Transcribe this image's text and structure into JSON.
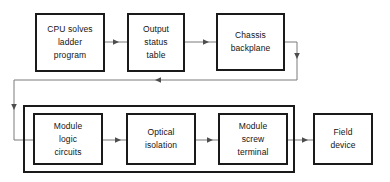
{
  "diagram": {
    "stroke_color": "#1a1a1a",
    "connector_color": "#7a7a7a",
    "background_color": "#ffffff",
    "nodes": [
      {
        "id": "cpu-solves-ladder-program",
        "lines": [
          "CPU solves",
          "ladder",
          "program"
        ],
        "x": 35,
        "y": 13,
        "w": 70,
        "h": 59
      },
      {
        "id": "output-status-table",
        "lines": [
          "Output",
          "status",
          "table"
        ],
        "x": 127,
        "y": 13,
        "w": 58,
        "h": 59
      },
      {
        "id": "chassis-backplane",
        "lines": [
          "Chassis",
          "backplane"
        ],
        "x": 216,
        "y": 13,
        "w": 69,
        "h": 58
      },
      {
        "id": "module-logic-circuits",
        "lines": [
          "Module",
          "logic",
          "circuits"
        ],
        "x": 33,
        "y": 113,
        "w": 70,
        "h": 52
      },
      {
        "id": "optical-isolation",
        "lines": [
          "Optical",
          "isolation"
        ],
        "x": 126,
        "y": 113,
        "w": 70,
        "h": 52
      },
      {
        "id": "module-screw-terminal",
        "lines": [
          "Module",
          "screw",
          "terminal"
        ],
        "x": 218,
        "y": 113,
        "w": 70,
        "h": 52
      },
      {
        "id": "field-device",
        "lines": [
          "Field",
          "device"
        ],
        "x": 313,
        "y": 113,
        "w": 60,
        "h": 52
      }
    ],
    "groups": [
      {
        "id": "io-module-group",
        "label": "",
        "x": 23,
        "y": 105,
        "w": 272,
        "h": 68
      }
    ],
    "connectors": [
      {
        "id": "cpu-to-output-status",
        "from": "cpu-solves-ladder-program",
        "to": "output-status-table",
        "arrow": "right"
      },
      {
        "id": "output-status-to-chassis",
        "from": "output-status-table",
        "to": "chassis-backplane",
        "arrow": "right"
      },
      {
        "id": "chassis-to-module-logic",
        "from": "chassis-backplane",
        "to": "module-logic-circuits",
        "arrow": "left-down"
      },
      {
        "id": "module-logic-to-optical",
        "from": "module-logic-circuits",
        "to": "optical-isolation",
        "arrow": "right"
      },
      {
        "id": "optical-to-screw-terminal",
        "from": "optical-isolation",
        "to": "module-screw-terminal",
        "arrow": "right"
      },
      {
        "id": "screw-terminal-to-field-device",
        "from": "module-screw-terminal",
        "to": "field-device",
        "arrow": "right"
      }
    ]
  }
}
